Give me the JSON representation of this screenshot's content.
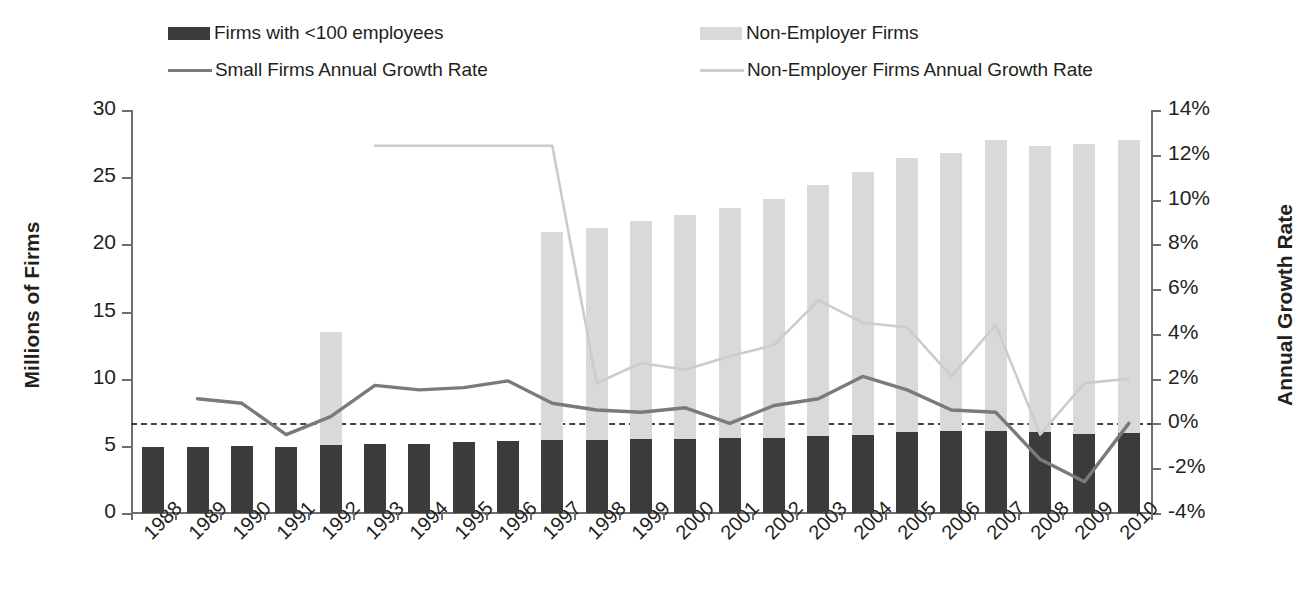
{
  "legend": {
    "items": [
      {
        "label": "Firms with <100 employees",
        "type": "box",
        "color": "#3b3b3b"
      },
      {
        "label": "Non-Employer Firms",
        "type": "box",
        "color": "#d9d9d9"
      },
      {
        "label": "Small Firms Annual Growth Rate",
        "type": "line",
        "color": "#7a7a7a"
      },
      {
        "label": "Non-Employer Firms Annual Growth Rate",
        "type": "line",
        "color": "#cccccc"
      }
    ]
  },
  "axes": {
    "y_left": {
      "title": "Millions of Firms",
      "ticks": [
        "30",
        "25",
        "20",
        "15",
        "10",
        "5",
        "0"
      ],
      "min": 0,
      "max": 30
    },
    "y_right": {
      "title": "Annual Growth Rate",
      "ticks": [
        "14%",
        "12%",
        "10%",
        "8%",
        "6%",
        "4%",
        "2%",
        "0%",
        "-2%",
        "-4%"
      ],
      "min": -4,
      "max": 14
    },
    "zero_reference": "0%"
  },
  "chart_data": {
    "type": "bar",
    "title": "",
    "xlabel": "",
    "ylabel": "Millions of Firms",
    "y2label": "Annual Growth Rate",
    "ylim": [
      0,
      30
    ],
    "y2lim": [
      -4,
      14
    ],
    "grid": false,
    "legend_position": "top",
    "categories": [
      "1988",
      "1989",
      "1990",
      "1991",
      "1992",
      "1993",
      "1994",
      "1995",
      "1996",
      "1997",
      "1998",
      "1999",
      "2000",
      "2001",
      "2002",
      "2003",
      "2004",
      "2005",
      "2006",
      "2007",
      "2008",
      "2009",
      "2010"
    ],
    "series": [
      {
        "name": "Firms with <100 employees",
        "type": "bar",
        "axis": "left",
        "color": "#3b3b3b",
        "values": [
          4.88,
          4.92,
          4.96,
          4.93,
          5.07,
          5.1,
          5.17,
          5.25,
          5.35,
          5.42,
          5.47,
          5.48,
          5.52,
          5.56,
          5.62,
          5.72,
          5.84,
          6.04,
          6.08,
          6.13,
          6.02,
          5.87,
          5.95
        ]
      },
      {
        "name": "Non-Employer Firms",
        "type": "bar",
        "axis": "left",
        "color": "#d9d9d9",
        "values": [
          null,
          null,
          null,
          null,
          13.5,
          null,
          null,
          null,
          null,
          20.9,
          21.2,
          21.7,
          22.2,
          22.7,
          23.4,
          24.4,
          25.4,
          26.4,
          26.8,
          27.8,
          27.3,
          27.5,
          27.8
        ]
      },
      {
        "name": "Small Firms Annual Growth Rate",
        "type": "line",
        "axis": "right",
        "color": "#7a7a7a",
        "values": [
          null,
          1.1,
          0.9,
          -0.5,
          0.3,
          1.7,
          1.5,
          1.6,
          1.9,
          0.9,
          0.6,
          0.5,
          0.7,
          0.0,
          0.8,
          1.1,
          2.1,
          1.5,
          0.6,
          0.5,
          -1.6,
          -2.6,
          0.0
        ]
      },
      {
        "name": "Non-Employer Firms Annual Growth Rate",
        "type": "line",
        "axis": "right",
        "color": "#cccccc",
        "values": [
          null,
          null,
          null,
          null,
          null,
          12.4,
          12.4,
          12.4,
          12.4,
          12.4,
          1.8,
          2.7,
          2.4,
          3.0,
          3.5,
          5.5,
          4.5,
          4.3,
          2.1,
          4.4,
          -0.5,
          1.8,
          2.0
        ]
      }
    ]
  }
}
